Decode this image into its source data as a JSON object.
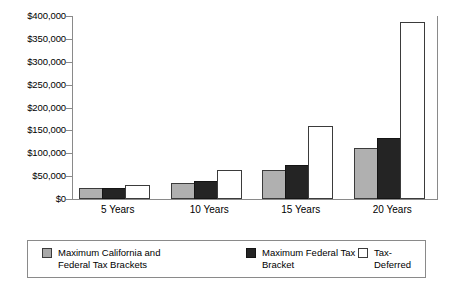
{
  "chart_data": {
    "type": "bar",
    "title": "",
    "xlabel": "",
    "ylabel": "",
    "categories": [
      "5 Years",
      "10 Years",
      "15 Years",
      "20 Years"
    ],
    "series": [
      {
        "name": "Maximum California and Federal Tax Brackets",
        "legend_line1": "Maximum California and",
        "legend_line2": "Federal Tax Brackets",
        "color": "#b0b0b0",
        "values": [
          20000,
          30000,
          58000,
          107000
        ]
      },
      {
        "name": "Maximum Federal Tax Bracket",
        "legend_line1": "Maximum Federal Tax",
        "legend_line2": "Bracket",
        "color": "#242424",
        "values": [
          19000,
          35000,
          70000,
          130000
        ]
      },
      {
        "name": "Tax-Deferred",
        "legend_line1": "Tax-Deferred",
        "legend_line2": "",
        "color": "#ffffff",
        "values": [
          26000,
          60000,
          156000,
          383000
        ]
      }
    ],
    "ylim": [
      0,
      400000
    ],
    "ytick_values": [
      0,
      50000,
      100000,
      150000,
      200000,
      250000,
      300000,
      350000,
      400000
    ],
    "ytick_labels": [
      "$0",
      "$50,000",
      "$100,000",
      "$150,000",
      "$200,000",
      "$250,000",
      "$300,000",
      "$350,000",
      "$400,000"
    ],
    "grid": false,
    "legend_position": "bottom"
  }
}
